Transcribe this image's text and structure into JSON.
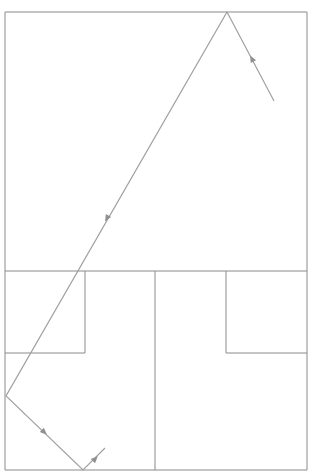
{
  "diagram": {
    "type": "light-ray-reflection-floorplan",
    "width": 313,
    "height": 476,
    "colors": {
      "wall": "#8a8a8a",
      "ray": "#a0a0a0",
      "arrow": "#909090",
      "background": "#ffffff"
    },
    "walls": [
      {
        "id": "outer-top",
        "x1": 5,
        "y1": 12,
        "x2": 307,
        "y2": 12
      },
      {
        "id": "outer-left",
        "x1": 5,
        "y1": 12,
        "x2": 5,
        "y2": 470
      },
      {
        "id": "outer-right",
        "x1": 307,
        "y1": 12,
        "x2": 307,
        "y2": 470
      },
      {
        "id": "outer-bottom",
        "x1": 5,
        "y1": 470,
        "x2": 307,
        "y2": 470
      },
      {
        "id": "divider-horizontal",
        "x1": 5,
        "y1": 271,
        "x2": 307,
        "y2": 271
      },
      {
        "id": "divider-vertical",
        "x1": 155,
        "y1": 271,
        "x2": 155,
        "y2": 470
      },
      {
        "id": "left-box-right",
        "x1": 85,
        "y1": 271,
        "x2": 85,
        "y2": 353
      },
      {
        "id": "left-box-bottom",
        "x1": 5,
        "y1": 353,
        "x2": 85,
        "y2": 353
      },
      {
        "id": "right-box-left",
        "x1": 226,
        "y1": 271,
        "x2": 226,
        "y2": 353
      },
      {
        "id": "right-box-bottom",
        "x1": 226,
        "y1": 353,
        "x2": 307,
        "y2": 353
      }
    ],
    "ray_path": [
      {
        "x": 274,
        "y": 101
      },
      {
        "x": 227,
        "y": 12
      },
      {
        "x": 6,
        "y": 396
      },
      {
        "x": 83,
        "y": 470
      },
      {
        "x": 105,
        "y": 448
      }
    ],
    "arrows": [
      {
        "id": "arrow-1",
        "x": 252,
        "y": 59,
        "angle": -118
      },
      {
        "id": "arrow-2",
        "x": 107,
        "y": 218,
        "angle": 120
      },
      {
        "id": "arrow-3",
        "x": 44,
        "y": 432,
        "angle": 44
      },
      {
        "id": "arrow-4",
        "x": 95,
        "y": 459,
        "angle": -45
      }
    ]
  }
}
